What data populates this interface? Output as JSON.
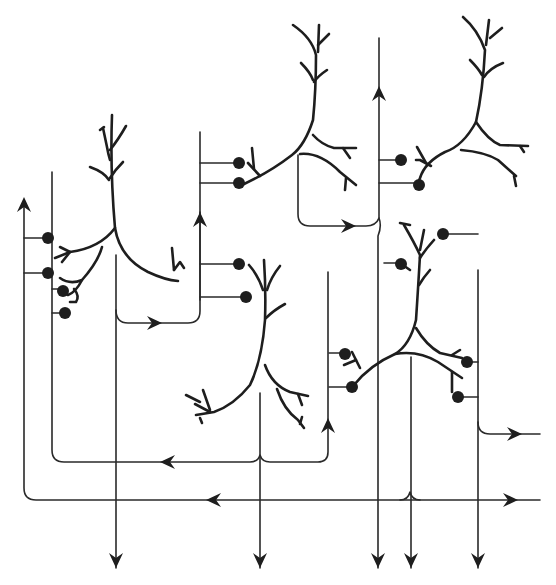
{
  "diagram": {
    "type": "neural-circuit-schematic",
    "colors": {
      "line": "#2a2a2a",
      "neuron": "#1e1e1e",
      "background": "#ffffff"
    },
    "neurons": [
      {
        "id": "neuron-1",
        "label": "neuron upper-left",
        "synapse_count": 4
      },
      {
        "id": "neuron-2",
        "label": "neuron top-center",
        "synapse_count": 2
      },
      {
        "id": "neuron-3",
        "label": "neuron top-right",
        "synapse_count": 2
      },
      {
        "id": "neuron-4",
        "label": "neuron center",
        "synapse_count": 2
      },
      {
        "id": "neuron-5",
        "label": "neuron right-center",
        "synapse_count": 2
      },
      {
        "id": "neuron-6",
        "label": "neuron lower-right",
        "synapse_count": 4
      }
    ],
    "outputs": {
      "bottom_arrows": 5,
      "right_arrows": 2
    }
  }
}
